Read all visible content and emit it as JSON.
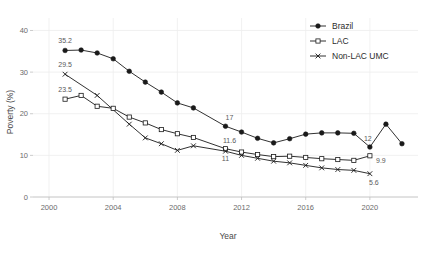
{
  "chart_data": {
    "type": "line",
    "title": "",
    "xlabel": "Year",
    "ylabel": "Poverty (%)",
    "xlim": [
      1999,
      2023
    ],
    "ylim": [
      0,
      43
    ],
    "xticks": [
      2000,
      2004,
      2008,
      2012,
      2016,
      2020
    ],
    "yticks": [
      0,
      10,
      20,
      30,
      40
    ],
    "grid": true,
    "legend_position": "top-right",
    "series": [
      {
        "name": "Brazil",
        "marker": "filled-circle",
        "x": [
          2001,
          2002,
          2003,
          2004,
          2005,
          2006,
          2007,
          2008,
          2009,
          2011,
          2012,
          2013,
          2014,
          2015,
          2016,
          2017,
          2018,
          2019,
          2020,
          2021,
          2022
        ],
        "values": [
          35.2,
          35.3,
          34.6,
          33.2,
          30.2,
          27.6,
          25.2,
          22.6,
          21.4,
          17.0,
          15.6,
          14.1,
          13.0,
          14.0,
          15.1,
          15.4,
          15.4,
          15.3,
          12.0,
          17.5,
          12.8
        ]
      },
      {
        "name": "LAC",
        "marker": "open-square",
        "x": [
          2001,
          2002,
          2003,
          2004,
          2005,
          2006,
          2007,
          2008,
          2009,
          2011,
          2012,
          2013,
          2014,
          2015,
          2016,
          2017,
          2018,
          2019,
          2020
        ],
        "values": [
          23.5,
          24.4,
          21.8,
          21.3,
          19.2,
          17.8,
          16.2,
          15.2,
          14.3,
          11.6,
          10.8,
          10.2,
          9.7,
          9.8,
          9.5,
          9.2,
          9.0,
          8.8,
          9.9
        ]
      },
      {
        "name": "Non-LAC UMC",
        "marker": "cross-x",
        "x": [
          2001,
          2003,
          2005,
          2006,
          2007,
          2008,
          2009,
          2011,
          2012,
          2013,
          2014,
          2015,
          2016,
          2017,
          2018,
          2019,
          2020
        ],
        "values": [
          29.5,
          24.4,
          17.5,
          14.2,
          12.8,
          11.2,
          12.3,
          11.0,
          10.0,
          9.3,
          8.6,
          8.2,
          7.6,
          7.0,
          6.6,
          6.4,
          5.6
        ]
      }
    ],
    "point_labels": [
      {
        "text": "35.2",
        "x": 2001,
        "y": 35.2,
        "dx": 0,
        "dy": -7,
        "anchor": "middle"
      },
      {
        "text": "29.5",
        "x": 2001,
        "y": 29.5,
        "dx": 0,
        "dy": -7,
        "anchor": "middle"
      },
      {
        "text": "23.5",
        "x": 2001,
        "y": 23.5,
        "dx": 0,
        "dy": -7,
        "anchor": "middle"
      },
      {
        "text": "17",
        "x": 2011,
        "y": 17.0,
        "dx": 4,
        "dy": -6,
        "anchor": "middle"
      },
      {
        "text": "11.6",
        "x": 2011,
        "y": 11.6,
        "dx": 4,
        "dy": -6,
        "anchor": "middle"
      },
      {
        "text": "11",
        "x": 2011,
        "y": 11.0,
        "dx": 0,
        "dy": 10,
        "anchor": "middle"
      },
      {
        "text": "12",
        "x": 2020,
        "y": 12.0,
        "dx": -2,
        "dy": -6,
        "anchor": "middle"
      },
      {
        "text": "9.9",
        "x": 2020,
        "y": 9.9,
        "dx": 11,
        "dy": 7,
        "anchor": "middle"
      },
      {
        "text": "5.6",
        "x": 2020,
        "y": 5.6,
        "dx": 4,
        "dy": 11,
        "anchor": "middle"
      }
    ]
  },
  "legend": {
    "items": [
      {
        "label": "Brazil",
        "marker": "filled-circle"
      },
      {
        "label": "LAC",
        "marker": "open-square"
      },
      {
        "label": "Non-LAC UMC",
        "marker": "cross-x"
      }
    ]
  },
  "colors": {
    "line": "#1a1a1a",
    "grid": "#ededed",
    "axis": "#bfbfbf",
    "tick_text": "#6b6b6b",
    "title_text": "#4a4a4a",
    "label_text": "#5a5a5a"
  }
}
